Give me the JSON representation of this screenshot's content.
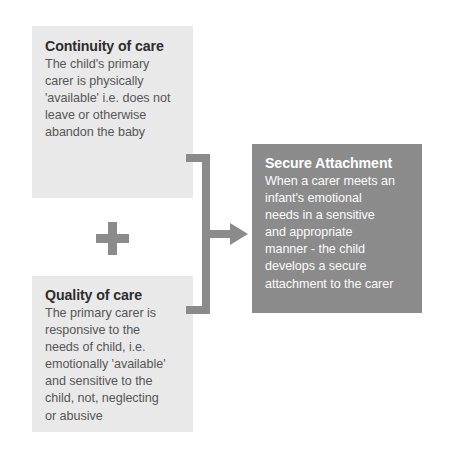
{
  "diagram": {
    "background_color": "#ffffff",
    "boxes": [
      {
        "id": "continuity",
        "title": "Continuity of care",
        "body": "The child's primary\ncarer is physically\n'available' i.e. does not\nleave or otherwise\nabandon the baby",
        "fill_color": "#e9e9e9",
        "title_color": "#2d2d2d",
        "body_color": "#565656",
        "role": "input"
      },
      {
        "id": "quality",
        "title": "Quality of care",
        "body": "The primary carer is\nresponsive to the\nneeds of child, i.e.\nemotionally 'available'\nand sensitive to the\nchild, not, neglecting\nor abusive",
        "fill_color": "#e9e9e9",
        "title_color": "#2d2d2d",
        "body_color": "#565656",
        "role": "input"
      },
      {
        "id": "secure",
        "title": "Secure Attachment",
        "body": "When a carer meets an\ninfant's emotional\nneeds in a sensitive\nand appropriate\nmanner - the child\ndevelops a secure\nattachment to the carer",
        "fill_color": "#8b8b8b",
        "title_color": "#ffffff",
        "body_color": "#fbfbfb",
        "role": "output"
      }
    ],
    "operator": {
      "symbol": "+",
      "name": "plus-sign",
      "color": "#8b8b8b"
    },
    "connector": {
      "name": "bracket-arrow",
      "color": "#8b8b8b",
      "direction": "right",
      "from": [
        "continuity",
        "quality"
      ],
      "to": "secure"
    }
  }
}
